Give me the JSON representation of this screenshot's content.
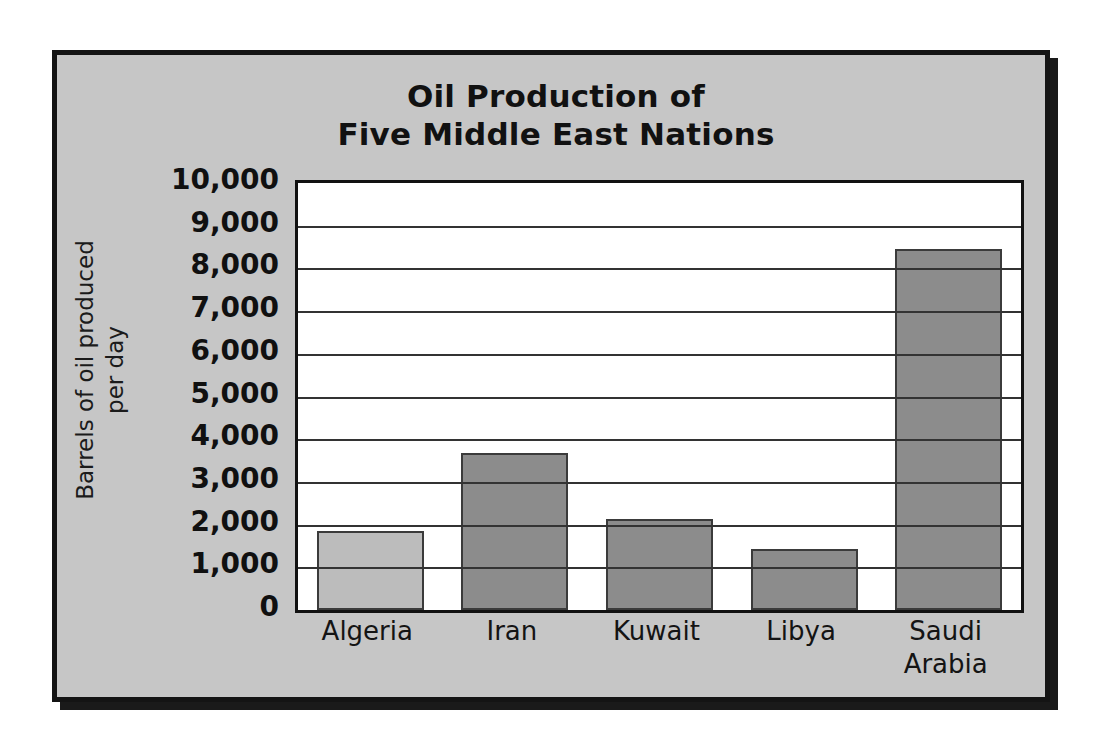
{
  "figure": {
    "background_color": "#c6c6c6",
    "frame_color": "#141414",
    "plot_background": "#ffffff"
  },
  "chart_data": {
    "type": "bar",
    "title": "Oil Production of Five Middle East Nations",
    "title_lines": [
      "Oil Production of",
      "Five Middle East Nations"
    ],
    "categories": [
      "Algeria",
      "Iran",
      "Kuwait",
      "Libya",
      "Saudi Arabia"
    ],
    "category_lines": [
      [
        "Algeria"
      ],
      [
        "Iran"
      ],
      [
        "Kuwait"
      ],
      [
        "Libya"
      ],
      [
        "Saudi",
        "Arabia"
      ]
    ],
    "values": [
      1850,
      3670,
      2130,
      1420,
      8450
    ],
    "bar_colors": [
      "#bcbcbc",
      "#8c8c8c",
      "#8c8c8c",
      "#8c8c8c",
      "#8c8c8c"
    ],
    "xlabel": "",
    "ylabel": "Barrels of oil produced per day",
    "ylabel_lines": [
      "Barrels of oil produced",
      "per day"
    ],
    "ylim": [
      0,
      10000
    ],
    "ytick_step": 1000,
    "yticks": [
      0,
      1000,
      2000,
      3000,
      4000,
      5000,
      6000,
      7000,
      8000,
      9000,
      10000
    ],
    "ytick_labels": [
      "0",
      "1,000",
      "2,000",
      "3,000",
      "4,000",
      "5,000",
      "6,000",
      "7,000",
      "8,000",
      "9,000",
      "10,000"
    ],
    "grid": true,
    "grid_axis": "y",
    "legend": false,
    "legend_position": "none"
  }
}
